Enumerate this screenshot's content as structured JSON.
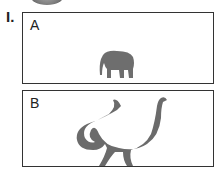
{
  "question": {
    "number": "I."
  },
  "options": [
    {
      "label": "A",
      "image": "elephant-icon"
    },
    {
      "label": "B",
      "image": "sauropod-dinosaur-icon"
    }
  ]
}
